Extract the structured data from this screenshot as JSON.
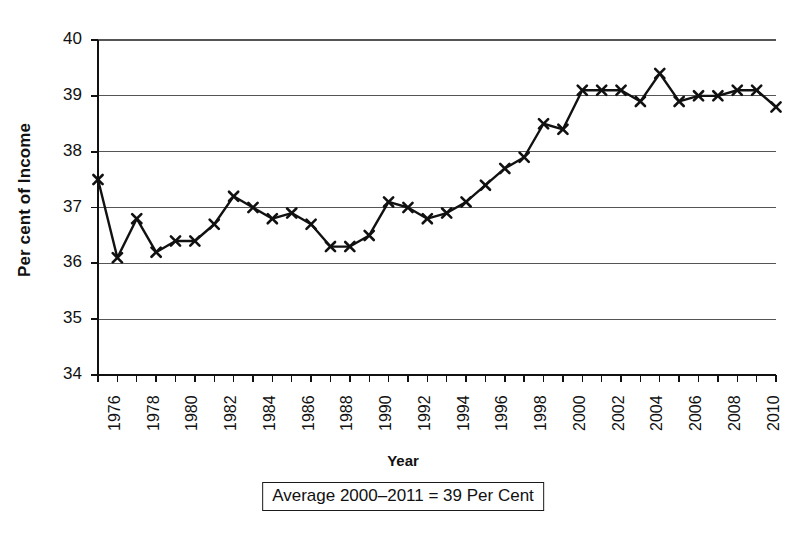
{
  "chart_data": {
    "type": "line",
    "title": "",
    "xlabel": "Year",
    "ylabel": "Per cent of Income",
    "ylim": [
      34,
      40
    ],
    "xlim": [
      1976,
      2011
    ],
    "y_ticks": [
      34,
      35,
      36,
      37,
      38,
      39,
      40
    ],
    "x_tick_labels": [
      "1976",
      "1978",
      "1980",
      "1982",
      "1984",
      "1986",
      "1988",
      "1990",
      "1992",
      "1994",
      "1996",
      "1998",
      "2000",
      "2002",
      "2004",
      "2006",
      "2008",
      "2010"
    ],
    "grid": true,
    "legend": "none",
    "marker": "x",
    "x": [
      1976,
      1977,
      1978,
      1979,
      1980,
      1981,
      1982,
      1983,
      1984,
      1985,
      1986,
      1987,
      1988,
      1989,
      1990,
      1991,
      1992,
      1993,
      1994,
      1995,
      1996,
      1997,
      1998,
      1999,
      2000,
      2001,
      2002,
      2003,
      2004,
      2005,
      2006,
      2007,
      2008,
      2009,
      2010,
      2011
    ],
    "values": [
      37.5,
      36.1,
      36.8,
      36.2,
      36.4,
      36.4,
      36.7,
      37.2,
      37.0,
      36.8,
      36.9,
      36.7,
      36.3,
      36.3,
      36.5,
      37.1,
      37.0,
      36.8,
      36.9,
      37.1,
      37.4,
      37.7,
      37.9,
      38.5,
      38.4,
      39.1,
      39.1,
      39.1,
      38.9,
      39.4,
      38.9,
      39.0,
      39.0,
      39.1,
      39.1,
      38.8
    ],
    "annotation": "Average 2000–2011 = 39 Per Cent"
  },
  "axis": {
    "y_title": "Per cent of Income",
    "x_title": "Year"
  }
}
